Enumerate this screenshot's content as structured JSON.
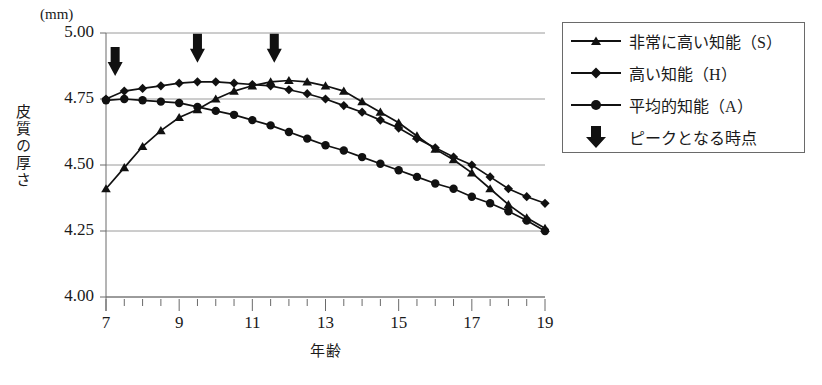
{
  "chart_data": {
    "type": "line",
    "title": "",
    "unit_label": "(mm)",
    "xlabel": "年齢",
    "ylabel": "皮質の厚さ",
    "xlim": [
      7,
      19
    ],
    "ylim": [
      4.0,
      5.0
    ],
    "yticks": [
      "5.00",
      "4.75",
      "4.50",
      "4.25",
      "4.00"
    ],
    "ytick_values": [
      5.0,
      4.75,
      4.5,
      4.25,
      4.0
    ],
    "xticks": [
      "7",
      "9",
      "11",
      "13",
      "15",
      "17",
      "19"
    ],
    "xtick_values": [
      7,
      9,
      11,
      13,
      15,
      17,
      19
    ],
    "xminor_step": 0.5,
    "grid": "horizontal",
    "legend_position": "top-right",
    "series": [
      {
        "name": "非常に高い知能（S）",
        "marker": "triangle",
        "x": [
          7,
          7.5,
          8,
          8.5,
          9,
          9.5,
          10,
          10.5,
          11,
          11.5,
          12,
          12.5,
          13,
          13.5,
          14,
          14.5,
          15,
          15.5,
          16,
          16.5,
          17,
          17.5,
          18,
          18.5,
          19
        ],
        "values": [
          4.41,
          4.49,
          4.57,
          4.63,
          4.68,
          4.71,
          4.75,
          4.78,
          4.8,
          4.815,
          4.82,
          4.815,
          4.8,
          4.78,
          4.74,
          4.7,
          4.66,
          4.61,
          4.56,
          4.52,
          4.47,
          4.41,
          4.35,
          4.3,
          4.26
        ]
      },
      {
        "name": "高い知能（H）",
        "marker": "diamond",
        "x": [
          7,
          7.5,
          8,
          8.5,
          9,
          9.5,
          10,
          10.5,
          11,
          11.5,
          12,
          12.5,
          13,
          13.5,
          14,
          14.5,
          15,
          15.5,
          16,
          16.5,
          17,
          17.5,
          18,
          18.5,
          19
        ],
        "values": [
          4.75,
          4.78,
          4.79,
          4.8,
          4.81,
          4.815,
          4.815,
          4.81,
          4.805,
          4.8,
          4.785,
          4.77,
          4.75,
          4.725,
          4.7,
          4.67,
          4.64,
          4.6,
          4.565,
          4.53,
          4.5,
          4.455,
          4.41,
          4.38,
          4.355
        ]
      },
      {
        "name": "平均的知能（A）",
        "marker": "circle",
        "x": [
          7,
          7.5,
          8,
          8.5,
          9,
          9.5,
          10,
          10.5,
          11,
          11.5,
          12,
          12.5,
          13,
          13.5,
          14,
          14.5,
          15,
          15.5,
          16,
          16.5,
          17,
          17.5,
          18,
          18.5,
          19
        ],
        "values": [
          4.745,
          4.75,
          4.745,
          4.74,
          4.735,
          4.72,
          4.705,
          4.69,
          4.67,
          4.65,
          4.625,
          4.6,
          4.575,
          4.555,
          4.53,
          4.505,
          4.48,
          4.455,
          4.43,
          4.41,
          4.38,
          4.355,
          4.325,
          4.29,
          4.25
        ]
      }
    ],
    "annotations": {
      "label": "ピークとなる時点",
      "marker": "down-arrow",
      "arrows": [
        {
          "x": 7.25,
          "y": 4.9
        },
        {
          "x": 9.5,
          "y": 4.95
        },
        {
          "x": 11.6,
          "y": 4.95
        }
      ]
    },
    "legend_entries": [
      {
        "label": "非常に高い知能（S）",
        "marker": "triangle"
      },
      {
        "label": "高い知能（H）",
        "marker": "diamond"
      },
      {
        "label": "平均的知能（A）",
        "marker": "circle"
      },
      {
        "label": "ピークとなる時点",
        "marker": "down-arrow"
      }
    ]
  }
}
